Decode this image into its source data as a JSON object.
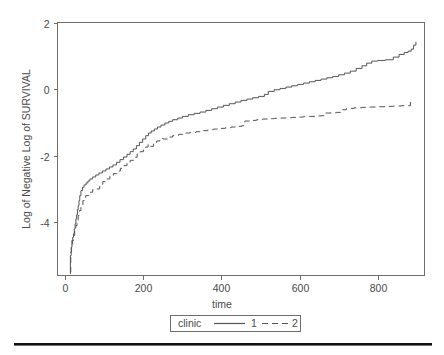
{
  "figure": {
    "background": "#ffffff",
    "line_color": "#555555",
    "axis_color": "#6e6e6e",
    "rule_color": "#111111"
  },
  "chart_data": {
    "type": "line",
    "title": "",
    "xlabel": "time",
    "ylabel": "Log of Negative Log of SURVIVAL",
    "xlim": [
      -20,
      920
    ],
    "ylim": [
      -5.6,
      2.0
    ],
    "xticks": [
      0,
      200,
      400,
      600,
      800
    ],
    "xtick_labels": [
      "0",
      "200",
      "400",
      "600",
      "800"
    ],
    "yticks": [
      2,
      0,
      -2,
      -4
    ],
    "ytick_labels": [
      "2",
      "0",
      "-2",
      "-4"
    ],
    "grid": false,
    "legend": {
      "title": "clinic",
      "position": "below-axes",
      "entries": [
        {
          "label": "1",
          "style": "solid"
        },
        {
          "label": "2",
          "style": "dashed"
        }
      ]
    },
    "series": [
      {
        "name": "1",
        "style": "solid",
        "points": [
          [
            12,
            -5.55
          ],
          [
            13,
            -5.0
          ],
          [
            15,
            -4.75
          ],
          [
            17,
            -4.55
          ],
          [
            19,
            -4.45
          ],
          [
            21,
            -4.35
          ],
          [
            23,
            -4.2
          ],
          [
            25,
            -4.05
          ],
          [
            27,
            -3.9
          ],
          [
            29,
            -3.78
          ],
          [
            31,
            -3.62
          ],
          [
            33,
            -3.5
          ],
          [
            35,
            -3.35
          ],
          [
            37,
            -3.2
          ],
          [
            40,
            -3.05
          ],
          [
            44,
            -2.95
          ],
          [
            48,
            -2.88
          ],
          [
            53,
            -2.82
          ],
          [
            58,
            -2.76
          ],
          [
            63,
            -2.7
          ],
          [
            70,
            -2.64
          ],
          [
            78,
            -2.58
          ],
          [
            86,
            -2.52
          ],
          [
            95,
            -2.46
          ],
          [
            104,
            -2.4
          ],
          [
            113,
            -2.34
          ],
          [
            122,
            -2.28
          ],
          [
            131,
            -2.2
          ],
          [
            140,
            -2.12
          ],
          [
            149,
            -2.04
          ],
          [
            158,
            -1.96
          ],
          [
            166,
            -1.88
          ],
          [
            174,
            -1.8
          ],
          [
            182,
            -1.7
          ],
          [
            190,
            -1.6
          ],
          [
            198,
            -1.5
          ],
          [
            206,
            -1.4
          ],
          [
            213,
            -1.32
          ],
          [
            220,
            -1.26
          ],
          [
            228,
            -1.2
          ],
          [
            236,
            -1.14
          ],
          [
            245,
            -1.08
          ],
          [
            255,
            -1.02
          ],
          [
            265,
            -0.97
          ],
          [
            275,
            -0.92
          ],
          [
            288,
            -0.87
          ],
          [
            300,
            -0.82
          ],
          [
            315,
            -0.77
          ],
          [
            330,
            -0.73
          ],
          [
            345,
            -0.69
          ],
          [
            360,
            -0.64
          ],
          [
            375,
            -0.59
          ],
          [
            390,
            -0.54
          ],
          [
            405,
            -0.49
          ],
          [
            420,
            -0.44
          ],
          [
            435,
            -0.39
          ],
          [
            450,
            -0.34
          ],
          [
            465,
            -0.3
          ],
          [
            480,
            -0.26
          ],
          [
            495,
            -0.22
          ],
          [
            510,
            -0.16
          ],
          [
            520,
            -0.07
          ],
          [
            535,
            -0.02
          ],
          [
            550,
            0.02
          ],
          [
            565,
            0.06
          ],
          [
            580,
            0.1
          ],
          [
            595,
            0.14
          ],
          [
            610,
            0.18
          ],
          [
            625,
            0.22
          ],
          [
            640,
            0.26
          ],
          [
            655,
            0.3
          ],
          [
            670,
            0.34
          ],
          [
            685,
            0.38
          ],
          [
            700,
            0.43
          ],
          [
            715,
            0.48
          ],
          [
            730,
            0.54
          ],
          [
            745,
            0.62
          ],
          [
            760,
            0.7
          ],
          [
            772,
            0.78
          ],
          [
            785,
            0.84
          ],
          [
            800,
            0.86
          ],
          [
            820,
            0.88
          ],
          [
            840,
            0.96
          ],
          [
            855,
            1.04
          ],
          [
            868,
            1.1
          ],
          [
            878,
            1.14
          ],
          [
            886,
            1.2
          ],
          [
            892,
            1.32
          ],
          [
            898,
            1.42
          ]
        ]
      },
      {
        "name": "2",
        "style": "dashed",
        "points": [
          [
            12,
            -5.5
          ],
          [
            14,
            -4.9
          ],
          [
            16,
            -4.7
          ],
          [
            18,
            -4.55
          ],
          [
            21,
            -4.4
          ],
          [
            24,
            -4.25
          ],
          [
            27,
            -4.1
          ],
          [
            30,
            -3.95
          ],
          [
            33,
            -3.8
          ],
          [
            36,
            -3.65
          ],
          [
            40,
            -3.5
          ],
          [
            45,
            -3.35
          ],
          [
            52,
            -3.2
          ],
          [
            60,
            -3.1
          ],
          [
            70,
            -3.02
          ],
          [
            80,
            -3.0
          ],
          [
            88,
            -2.86
          ],
          [
            96,
            -2.78
          ],
          [
            105,
            -2.7
          ],
          [
            114,
            -2.62
          ],
          [
            123,
            -2.54
          ],
          [
            132,
            -2.46
          ],
          [
            141,
            -2.38
          ],
          [
            150,
            -2.3
          ],
          [
            158,
            -2.22
          ],
          [
            166,
            -2.14
          ],
          [
            175,
            -2.05
          ],
          [
            184,
            -1.95
          ],
          [
            192,
            -1.88
          ],
          [
            200,
            -1.82
          ],
          [
            206,
            -1.74
          ],
          [
            212,
            -1.66
          ],
          [
            218,
            -1.72
          ],
          [
            226,
            -1.64
          ],
          [
            234,
            -1.56
          ],
          [
            242,
            -1.48
          ],
          [
            250,
            -1.5
          ],
          [
            262,
            -1.44
          ],
          [
            275,
            -1.4
          ],
          [
            290,
            -1.36
          ],
          [
            305,
            -1.32
          ],
          [
            320,
            -1.3
          ],
          [
            335,
            -1.28
          ],
          [
            350,
            -1.25
          ],
          [
            365,
            -1.22
          ],
          [
            380,
            -1.2
          ],
          [
            395,
            -1.18
          ],
          [
            410,
            -1.16
          ],
          [
            425,
            -1.14
          ],
          [
            440,
            -1.12
          ],
          [
            452,
            -1.1
          ],
          [
            460,
            -0.96
          ],
          [
            475,
            -0.94
          ],
          [
            490,
            -0.92
          ],
          [
            505,
            -0.9
          ],
          [
            520,
            -0.89
          ],
          [
            535,
            -0.88
          ],
          [
            550,
            -0.87
          ],
          [
            565,
            -0.86
          ],
          [
            580,
            -0.85
          ],
          [
            595,
            -0.84
          ],
          [
            610,
            -0.83
          ],
          [
            625,
            -0.82
          ],
          [
            640,
            -0.81
          ],
          [
            655,
            -0.8
          ],
          [
            665,
            -0.72
          ],
          [
            680,
            -0.71
          ],
          [
            695,
            -0.7
          ],
          [
            705,
            -0.62
          ],
          [
            720,
            -0.58
          ],
          [
            740,
            -0.56
          ],
          [
            760,
            -0.55
          ],
          [
            780,
            -0.54
          ],
          [
            800,
            -0.53
          ],
          [
            820,
            -0.52
          ],
          [
            840,
            -0.51
          ],
          [
            860,
            -0.5
          ],
          [
            875,
            -0.5
          ],
          [
            884,
            -0.5
          ],
          [
            884,
            -0.36
          ]
        ]
      }
    ]
  }
}
